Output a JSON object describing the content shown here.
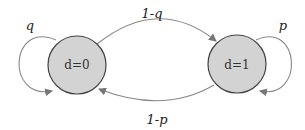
{
  "diagram": {
    "type": "markov-chain",
    "states": [
      {
        "id": "s0",
        "label": "d=0"
      },
      {
        "id": "s1",
        "label": "d=1"
      }
    ],
    "transitions": [
      {
        "from": "s0",
        "to": "s0",
        "label": "q"
      },
      {
        "from": "s0",
        "to": "s1",
        "label": "1-q"
      },
      {
        "from": "s1",
        "to": "s1",
        "label": "p"
      },
      {
        "from": "s1",
        "to": "s0",
        "label": "1-p"
      }
    ],
    "colors": {
      "state_fill": "#d3d3d3",
      "edge": "#888888"
    }
  }
}
